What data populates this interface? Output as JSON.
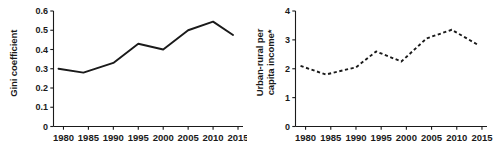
{
  "figure": {
    "panels": [
      {
        "id": "gini",
        "ylabel": "Gini coefficient",
        "ylabel_line1": "Gini coefficient",
        "ylabel_line2": ""
      },
      {
        "id": "urban-rural",
        "ylabel": "Urban-rural per capita income*",
        "ylabel_line1": "Urban-rural per",
        "ylabel_line2": "capita income*"
      }
    ]
  },
  "chart_data": [
    {
      "type": "line",
      "id": "gini-coefficient",
      "title": "",
      "xlabel": "",
      "ylabel": "Gini coefficient",
      "line_style": "solid",
      "line_color": "#1a1a1a",
      "grid": false,
      "legend": "none",
      "xlim": [
        1978,
        2016
      ],
      "ylim": [
        0,
        0.6
      ],
      "xticks": [
        1980,
        1985,
        1990,
        1995,
        2000,
        2005,
        2010,
        2015
      ],
      "xticklabels": [
        "1980",
        "1985",
        "1990",
        "1995",
        "2000",
        "2005",
        "2010",
        "2015"
      ],
      "yticks": [
        0,
        0.1,
        0.2,
        0.3,
        0.4,
        0.5,
        0.6
      ],
      "yticklabels": [
        "0",
        "0.1",
        "0.2",
        "0.3",
        "0.4",
        "0.5",
        "0.6"
      ],
      "x": [
        1979,
        1984,
        1990,
        1995,
        2000,
        2005,
        2010,
        2014
      ],
      "values": [
        0.3,
        0.28,
        0.33,
        0.43,
        0.4,
        0.5,
        0.545,
        0.475
      ]
    },
    {
      "type": "line",
      "id": "urban-rural-per-capita-income",
      "title": "",
      "xlabel": "",
      "ylabel": "Urban-rural per capita income*",
      "line_style": "dashed",
      "line_color": "#1a1a1a",
      "grid": false,
      "legend": "none",
      "xlim": [
        1978,
        2016
      ],
      "ylim": [
        0,
        4
      ],
      "xticks": [
        1980,
        1985,
        1990,
        1995,
        2000,
        2005,
        2010,
        2015
      ],
      "xticklabels": [
        "1980",
        "1985",
        "1990",
        "1995",
        "2000",
        "2005",
        "2010",
        "2015"
      ],
      "yticks": [
        0,
        1,
        2,
        3,
        4
      ],
      "yticklabels": [
        "0",
        "1",
        "2",
        "3",
        "4"
      ],
      "x": [
        1979,
        1984,
        1990,
        1994,
        1999,
        2004,
        2009,
        2014
      ],
      "values": [
        2.1,
        1.8,
        2.05,
        2.6,
        2.25,
        3.05,
        3.35,
        2.85
      ]
    }
  ]
}
